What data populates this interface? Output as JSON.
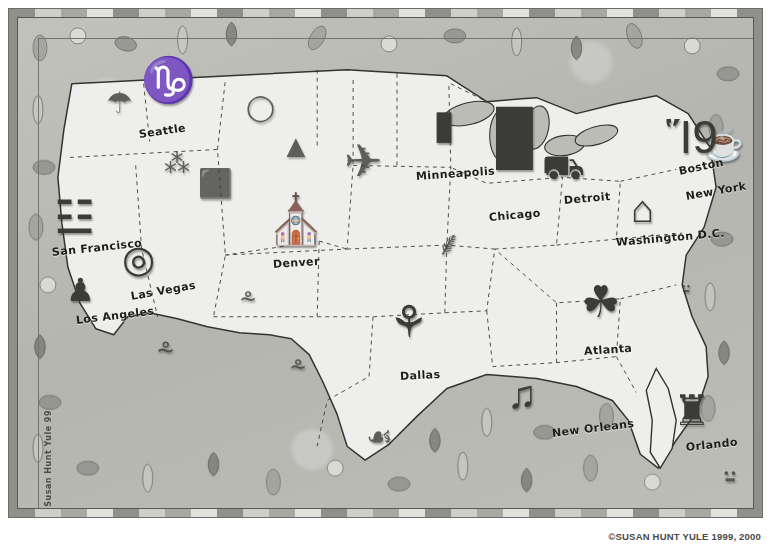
{
  "artwork": {
    "title": "Illustrated Pictorial Map of the United States",
    "signature": "Susan Hunt Yule 99",
    "copyright": "©SUSAN HUNT YULE 1999, 2000",
    "colors": {
      "ocean": "#b9b9b4",
      "land": "#eeeeec",
      "ink": "#2a2a27",
      "frame_light": "#e2e2dd",
      "frame_dark": "#8f8f8b"
    }
  },
  "cities": [
    {
      "name": "Seattle",
      "label_x": 121,
      "label_y": 110,
      "rotate": -8,
      "icon": "space-needle-icon",
      "glyph": "♑",
      "icon_x": 123,
      "icon_y": 40,
      "icon_size": 44
    },
    {
      "name": "San Francisco",
      "label_x": 34,
      "label_y": 228,
      "rotate": -6,
      "icon": "golden-gate-bridge-icon",
      "glyph": "☳",
      "icon_x": 36,
      "icon_y": 176,
      "icon_size": 46
    },
    {
      "name": "Los Angeles",
      "label_x": 58,
      "label_y": 296,
      "rotate": -7,
      "icon": "film-director-icon",
      "glyph": "♟",
      "icon_x": 48,
      "icon_y": 256,
      "icon_size": 32
    },
    {
      "name": "Las Vegas",
      "label_x": 113,
      "label_y": 272,
      "rotate": -10,
      "icon": "roulette-wheel-icon",
      "glyph": "◎",
      "icon_x": 104,
      "icon_y": 222,
      "icon_size": 38
    },
    {
      "name": "Denver",
      "label_x": 255,
      "label_y": 240,
      "rotate": -4,
      "icon": "state-capitol-icon",
      "glyph": "⛪",
      "icon_x": 248,
      "icon_y": 178,
      "icon_size": 48
    },
    {
      "name": "Dallas",
      "label_x": 382,
      "label_y": 352,
      "rotate": -3,
      "icon": "reunion-tower-icon",
      "glyph": "⚘",
      "icon_x": 371,
      "icon_y": 282,
      "icon_size": 44
    },
    {
      "name": "Minneapolis",
      "label_x": 398,
      "label_y": 152,
      "rotate": -4,
      "icon": "tower-icon",
      "glyph": "▮",
      "icon_x": 415,
      "icon_y": 86,
      "icon_size": 40
    },
    {
      "name": "Chicago",
      "label_x": 471,
      "label_y": 193,
      "rotate": -5,
      "icon": "sears-tower-icon",
      "glyph": "█",
      "icon_x": 478,
      "icon_y": 92,
      "icon_size": 52
    },
    {
      "name": "Detroit",
      "label_x": 546,
      "label_y": 176,
      "rotate": -5,
      "icon": "automobile-icon",
      "glyph": "⛟",
      "icon_x": 524,
      "icon_y": 132,
      "icon_size": 34
    },
    {
      "name": "Boston",
      "label_x": 661,
      "label_y": 147,
      "rotate": -12,
      "icon": "teapot-icon",
      "glyph": "☕",
      "icon_x": 686,
      "icon_y": 110,
      "icon_size": 32
    },
    {
      "name": "New York",
      "label_x": 668,
      "label_y": 172,
      "rotate": -10,
      "icon": "skyscrapers-icon",
      "glyph": "Ἵ9",
      "icon_x": 648,
      "icon_y": 96,
      "icon_size": 46
    },
    {
      "name": "Washington D.C.",
      "label_x": 598,
      "label_y": 218,
      "rotate": -5,
      "icon": "us-capitol-icon",
      "glyph": "⌂",
      "icon_x": 613,
      "icon_y": 172,
      "icon_size": 38
    },
    {
      "name": "Atlanta",
      "label_x": 566,
      "label_y": 327,
      "rotate": -4,
      "icon": "peach-city-icon",
      "glyph": "☘",
      "icon_x": 563,
      "icon_y": 262,
      "icon_size": 44
    },
    {
      "name": "New Orleans",
      "label_x": 534,
      "label_y": 409,
      "rotate": -7,
      "icon": "jazz-riverboat-icon",
      "glyph": "♫",
      "icon_x": 489,
      "icon_y": 356,
      "icon_size": 40
    },
    {
      "name": "Orlando",
      "label_x": 668,
      "label_y": 423,
      "rotate": -6,
      "icon": "fairytale-castle-icon",
      "glyph": "♜",
      "icon_x": 655,
      "icon_y": 372,
      "icon_size": 42
    }
  ],
  "scenery": [
    {
      "name": "mushroom-icon",
      "glyph": "☂",
      "x": 88,
      "y": 70,
      "size": 30
    },
    {
      "name": "berry-basket-icon",
      "glyph": "⁂",
      "x": 146,
      "y": 132,
      "size": 26
    },
    {
      "name": "potato-icon",
      "glyph": "◯",
      "x": 228,
      "y": 76,
      "size": 26
    },
    {
      "name": "evergreen-trees-icon",
      "glyph": "▲",
      "x": 262,
      "y": 112,
      "size": 32
    },
    {
      "name": "airplane-icon",
      "glyph": "✈",
      "x": 326,
      "y": 120,
      "size": 46
    },
    {
      "name": "salt-shaker-icon",
      "glyph": "⬛",
      "x": 180,
      "y": 152,
      "size": 28
    },
    {
      "name": "wheat-sheaf-icon",
      "glyph": "⸙",
      "x": 418,
      "y": 208,
      "size": 34
    },
    {
      "name": "cactus-left-icon",
      "glyph": "⸛",
      "x": 139,
      "y": 318,
      "size": 30
    },
    {
      "name": "cactus-mid-icon",
      "glyph": "⸛",
      "x": 222,
      "y": 268,
      "size": 28
    },
    {
      "name": "cactus-right-icon",
      "glyph": "⸛",
      "x": 272,
      "y": 336,
      "size": 28
    },
    {
      "name": "armadillo-icon",
      "glyph": "☙",
      "x": 348,
      "y": 404,
      "size": 30
    },
    {
      "name": "palm-trees-icon",
      "glyph": "⸚",
      "x": 706,
      "y": 440,
      "size": 38
    },
    {
      "name": "florida-palm-icon",
      "glyph": "⸚",
      "x": 664,
      "y": 258,
      "size": 26
    }
  ],
  "states_note": {
    "border_style": "dashed",
    "coastline_style": "solid-ink"
  }
}
